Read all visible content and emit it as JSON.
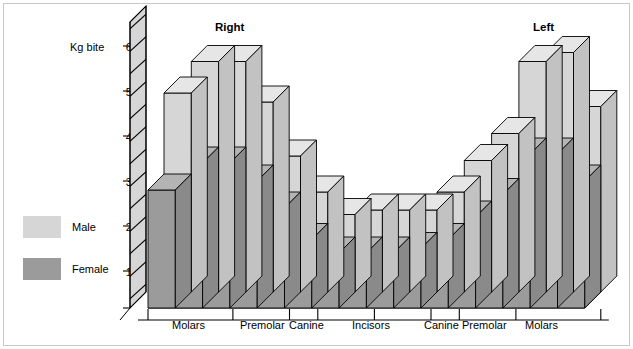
{
  "figure": {
    "axis_title": "Kg bite",
    "panel_labels": {
      "left_group": "Right",
      "right_group": "Left"
    }
  },
  "legend": {
    "items": [
      {
        "label": "Male",
        "color": "#d6d6d6"
      },
      {
        "label": "Female",
        "color": "#9b9b9b"
      }
    ]
  },
  "axes": {
    "y_ticks": [
      "60",
      "50",
      "40",
      "30",
      "20",
      "10"
    ],
    "y_values": [
      60,
      50,
      40,
      30,
      20,
      10
    ],
    "x_group_labels": [
      "Molars",
      "Premolar",
      "Canine",
      "Incisors",
      "Canine",
      "Premolar",
      "Molars"
    ]
  },
  "chart_data": {
    "type": "bar",
    "title": "",
    "subtitle": "",
    "xlabel": "",
    "ylabel": "Kg bite",
    "ylim": [
      0,
      65
    ],
    "grid": false,
    "legend_position": "left",
    "annotations": [
      "Right",
      "Left"
    ],
    "categories": [
      "Right Molar 3",
      "Right Molar 2",
      "Right Molar 1",
      "Right Premolar 2",
      "Right Premolar 1",
      "Right Canine",
      "Right Incisor 2",
      "Right Incisor 1",
      "Left Incisor 1",
      "Left Incisor 2",
      "Left Canine",
      "Left Premolar 1",
      "Left Premolar 2",
      "Left Molar 1",
      "Left Molar 2",
      "Left Molar 3"
    ],
    "series": [
      {
        "name": "Male",
        "color": "#d6d6d6",
        "values": [
          46,
          53,
          53,
          44,
          32,
          24,
          19,
          20,
          20,
          20,
          24,
          31,
          37,
          53,
          55,
          43
        ]
      },
      {
        "name": "Female",
        "color": "#9b9b9b",
        "values": [
          28,
          34,
          34,
          30,
          24,
          17,
          14,
          14,
          14,
          15,
          17,
          22,
          27,
          36,
          36,
          30
        ]
      }
    ]
  }
}
